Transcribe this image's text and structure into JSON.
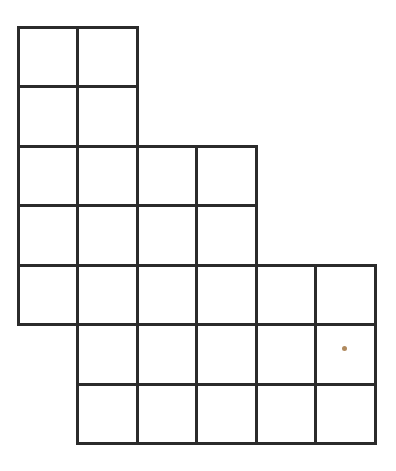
{
  "canvas": {
    "width": 396,
    "height": 471,
    "background_color": "#ffffff",
    "description": "Staircase-shaped polyomino figure drawn as a grid of unit squares"
  },
  "figure": {
    "name": "staircase-grid-figure",
    "line_color": "#2b2b2b",
    "line_width": 3,
    "fill_color": "#ffffff",
    "cell_size": 59.5,
    "origin_x": 18,
    "origin_y": 27,
    "columns": 6,
    "rows": 7,
    "total_cells": 25,
    "rows_spec": [
      {
        "row_index": 0,
        "col_start": 0,
        "col_end": 2,
        "cells": 2
      },
      {
        "row_index": 1,
        "col_start": 0,
        "col_end": 2,
        "cells": 2
      },
      {
        "row_index": 2,
        "col_start": 0,
        "col_end": 4,
        "cells": 4
      },
      {
        "row_index": 3,
        "col_start": 0,
        "col_end": 4,
        "cells": 4
      },
      {
        "row_index": 4,
        "col_start": 0,
        "col_end": 6,
        "cells": 6
      },
      {
        "row_index": 5,
        "col_start": 1,
        "col_end": 6,
        "cells": 5
      },
      {
        "row_index": 6,
        "col_start": 1,
        "col_end": 6,
        "cells": 5
      }
    ],
    "x_gridlines": [
      18,
      77.5,
      137,
      196.5,
      256,
      315.5,
      375
    ],
    "y_gridlines": [
      27,
      86.5,
      146,
      205.5,
      265,
      324.5,
      384,
      443.5
    ]
  },
  "marker": {
    "name": "marker-dot",
    "color": "#b08a5e",
    "x": 344,
    "y": 348,
    "diameter": 5,
    "cell_row": 5,
    "cell_col": 5
  }
}
